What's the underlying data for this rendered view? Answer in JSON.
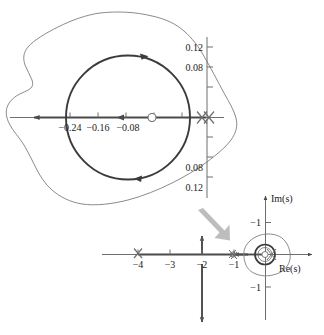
{
  "figure": {
    "kind": "root-locus",
    "colors": {
      "locus": "#3b3b3b",
      "axis": "#6e6e6e",
      "contour": "#7d7d7d",
      "pointer": "#b0b0b0",
      "text": "#1a1a1a"
    }
  },
  "inset": {
    "name": "magnified-view",
    "real_ticks": [
      {
        "label": "−0.24",
        "value": -0.24
      },
      {
        "label": "−0.16",
        "value": -0.16
      },
      {
        "label": "−0.08",
        "value": -0.08
      }
    ],
    "imag_ticks_upper": [
      {
        "label": "0.12",
        "value": 0.12
      },
      {
        "label": "0.08",
        "value": 0.08
      }
    ],
    "imag_ticks_lower": [
      {
        "label": "0.08",
        "value": -0.08
      },
      {
        "label": "0.12",
        "value": -0.12
      }
    ],
    "zero_marker": {
      "label": "zero",
      "re": -0.105,
      "im": 0
    },
    "pole_markers": [
      {
        "label": "pole",
        "re": -0.008,
        "im": 0
      },
      {
        "label": "pole",
        "re": 0.004,
        "im": 0
      }
    ],
    "circle_locus": {
      "center_re": -0.105,
      "center_im": 0,
      "radius": 0.105
    }
  },
  "main": {
    "name": "complex-plane",
    "axis_x_label": "Re(s)",
    "axis_y_label": "Im(s)",
    "real_ticks": [
      {
        "label": "−4",
        "value": -4
      },
      {
        "label": "−3",
        "value": -3
      },
      {
        "label": "−2",
        "value": -2
      },
      {
        "label": "−1",
        "value": -1
      }
    ],
    "imag_ticks": [
      {
        "label": "−1",
        "value": 1
      },
      {
        "label": "−1",
        "value": -1
      }
    ],
    "poles": [
      {
        "label": "pole",
        "re": -4,
        "im": 0
      },
      {
        "label": "pole",
        "re": -1,
        "im": 0
      },
      {
        "label": "pole",
        "re": -0.1,
        "im": 0
      }
    ],
    "asymptote_real": -2
  }
}
